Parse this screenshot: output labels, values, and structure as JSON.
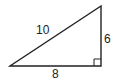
{
  "figure": {
    "type": "right-triangle",
    "labels": {
      "hypotenuse": "10",
      "vertical_leg": "6",
      "horizontal_leg": "8"
    },
    "right_angle_marker": true,
    "stroke_color": "#222222",
    "background": "#ffffff"
  }
}
